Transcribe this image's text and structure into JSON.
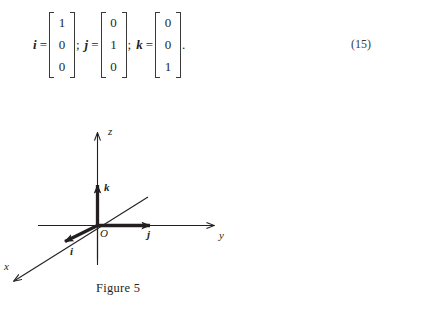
{
  "equation": {
    "number": "(15)",
    "vectors": [
      {
        "symbol": "i",
        "equals": "=",
        "entries": [
          "1",
          "0",
          "0"
        ],
        "separator": ";"
      },
      {
        "symbol": "j",
        "equals": "=",
        "entries": [
          "0",
          "1",
          "0"
        ],
        "separator": ";"
      },
      {
        "symbol": "k",
        "equals": "=",
        "entries": [
          "0",
          "0",
          "1"
        ],
        "separator": ""
      }
    ],
    "terminator": "."
  },
  "figure": {
    "caption": "Figure 5",
    "axis_labels": {
      "x": "x",
      "y": "y",
      "z": "z"
    },
    "origin_label": "O",
    "vector_labels": {
      "i": "i",
      "j": "j",
      "k": "k"
    },
    "colors": {
      "axis_line": "#231f20",
      "vector": "#231f20",
      "background": "#ffffff"
    }
  }
}
